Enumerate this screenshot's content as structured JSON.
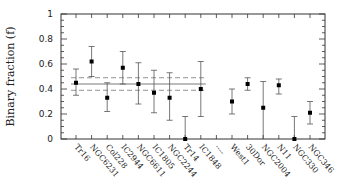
{
  "chart_data": {
    "type": "scatter",
    "title": "",
    "xlabel": "",
    "ylabel": "Binary fraction (f)",
    "ylim": [
      0,
      1
    ],
    "yticks": [
      "0",
      "0.2",
      "0.4",
      "0.6",
      "0.8",
      "1"
    ],
    "grid": false,
    "legend": null,
    "categories": [
      "Tr16",
      "NGC6231",
      "Col228",
      "IC2944",
      "NGC6611",
      "IC1805",
      "NGC2244",
      "Tr14",
      "IC1848",
      "----",
      "West1",
      "30Dor",
      "NGC2004",
      "N11",
      "NGC330",
      "NGC346"
    ],
    "series": [
      {
        "name": "Binary fraction",
        "points": [
          {
            "label": "Tr16",
            "value": 0.45,
            "err_low": 0.35,
            "err_high": 0.56
          },
          {
            "label": "NGC6231",
            "value": 0.62,
            "err_low": 0.5,
            "err_high": 0.74
          },
          {
            "label": "Col228",
            "value": 0.33,
            "err_low": 0.22,
            "err_high": 0.45
          },
          {
            "label": "IC2944",
            "value": 0.57,
            "err_low": 0.44,
            "err_high": 0.7
          },
          {
            "label": "NGC6611",
            "value": 0.44,
            "err_low": 0.28,
            "err_high": 0.61
          },
          {
            "label": "IC1805",
            "value": 0.37,
            "err_low": 0.21,
            "err_high": 0.55
          },
          {
            "label": "NGC2244",
            "value": 0.33,
            "err_low": 0.15,
            "err_high": 0.53
          },
          {
            "label": "Tr14",
            "value": 0.0,
            "err_low": 0.0,
            "err_high": 0.18
          },
          {
            "label": "IC1848",
            "value": 0.4,
            "err_low": 0.18,
            "err_high": 0.62
          },
          {
            "label": "West1",
            "value": 0.3,
            "err_low": 0.2,
            "err_high": 0.4
          },
          {
            "label": "30Dor",
            "value": 0.44,
            "err_low": 0.39,
            "err_high": 0.49
          },
          {
            "label": "NGC2004",
            "value": 0.25,
            "err_low": 0.0,
            "err_high": 0.46
          },
          {
            "label": "N11",
            "value": 0.43,
            "err_low": 0.36,
            "err_high": 0.48
          },
          {
            "label": "NGC330",
            "value": 0.0,
            "err_low": 0.0,
            "err_high": 0.18
          },
          {
            "label": "NGC346",
            "value": 0.21,
            "err_low": 0.12,
            "err_high": 0.3
          }
        ]
      }
    ],
    "reference_lines": {
      "mean": 0.44,
      "dashed_upper": 0.49,
      "dashed_lower": 0.39,
      "span_categories": [
        "Tr16",
        "IC1848"
      ]
    }
  }
}
